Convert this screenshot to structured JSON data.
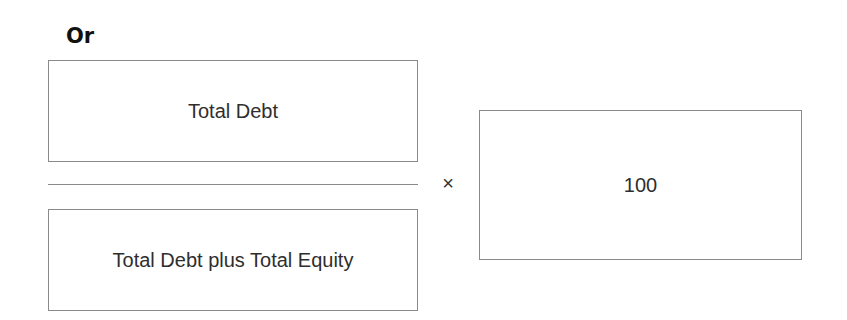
{
  "heading": "Or",
  "formula": {
    "numerator": "Total Debt",
    "denominator": "Total Debt plus Total Equity",
    "operator": "×",
    "multiplier": "100"
  },
  "colors": {
    "border": "#8a8a8a",
    "text": "#2e2e2e",
    "heading": "#111111",
    "background": "#ffffff"
  }
}
